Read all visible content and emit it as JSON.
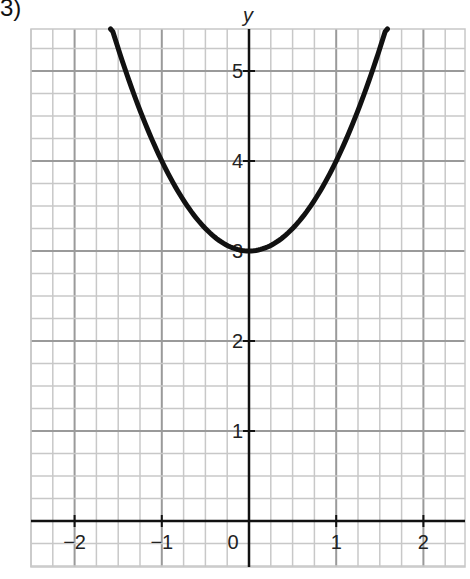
{
  "figure_label": "3)",
  "chart_data": {
    "type": "line",
    "title": "",
    "xlabel": "",
    "ylabel": "y",
    "function": "y = x^2 + 3",
    "xlim": [
      -2.5,
      2.5
    ],
    "ylim": [
      -0.5,
      5.5
    ],
    "x_ticks": [
      -2,
      -1,
      0,
      1,
      2
    ],
    "x_tick_labels": [
      "−2",
      "−1",
      "0",
      "1",
      "2"
    ],
    "y_ticks": [
      1,
      2,
      3,
      4,
      5
    ],
    "y_tick_labels": [
      "1",
      "2",
      "3",
      "4",
      "5"
    ],
    "grid": true,
    "minor_grid_per_unit_x": 4,
    "minor_grid_per_unit_y": 4,
    "series": [
      {
        "name": "y = x^2 + 3",
        "x": [
          -1.58,
          -1.5,
          -1,
          -0.5,
          0,
          0.5,
          1,
          1.5,
          1.58
        ],
        "y": [
          5.5,
          5.25,
          4,
          3.25,
          3,
          3.25,
          4,
          5.25,
          5.5
        ]
      }
    ]
  },
  "colors": {
    "grid": "#c8c8c8",
    "major_grid": "#9a9a9a",
    "axis": "#111111",
    "curve": "#111111"
  }
}
